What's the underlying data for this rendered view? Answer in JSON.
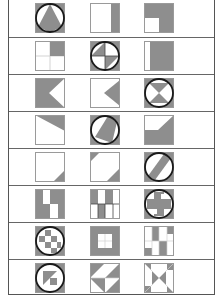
{
  "colors": {
    "fill": "#8e8e8e",
    "outline": "#9a9a9a",
    "circle": "#1a1a1a",
    "background": "#ffffff",
    "divider": "#666666"
  },
  "layout": {
    "row_height": 37,
    "col_x": [
      34,
      89,
      143
    ]
  },
  "rows": [
    {
      "tiles": [
        {
          "name": "triangle-in-circle",
          "circle": true,
          "shapes": [
            {
              "t": "rect",
              "x": 0,
              "y": 0,
              "w": 30,
              "h": 30
            },
            {
              "t": "circle-white"
            },
            {
              "t": "poly",
              "p": "15,1 27,24 15,29 3,24"
            }
          ]
        },
        {
          "name": "right-strip",
          "shapes": [
            {
              "t": "rect",
              "x": 21,
              "y": 0,
              "w": 9,
              "h": 30
            }
          ]
        },
        {
          "name": "l-shape-missing-bottom-left",
          "shapes": [
            {
              "t": "poly",
              "p": "0,0 30,0 30,30 15,30 15,15 0,15"
            }
          ]
        }
      ]
    },
    {
      "tiles": [
        {
          "name": "top-right-quadrant",
          "grid": true,
          "shapes": [
            {
              "t": "rect",
              "x": 15,
              "y": 0,
              "w": 15,
              "h": 15
            }
          ]
        },
        {
          "name": "quadrants-in-circle",
          "circle": true,
          "shapes": [
            {
              "t": "rect",
              "x": 0,
              "y": 0,
              "w": 30,
              "h": 30
            },
            {
              "t": "circle-white"
            },
            {
              "t": "poly",
              "p": "15,15 15,1 1,15"
            },
            {
              "t": "poly",
              "p": "15,15 29,15 15,29"
            },
            {
              "t": "lines",
              "p": "15,1 15,29 M1,15 29,15"
            }
          ]
        },
        {
          "name": "mostly-filled-left-strip",
          "shapes": [
            {
              "t": "rect",
              "x": 6,
              "y": 0,
              "w": 24,
              "h": 30
            }
          ]
        }
      ]
    },
    {
      "tiles": [
        {
          "name": "arrow-notch-right",
          "shapes": [
            {
              "t": "poly",
              "p": "0,0 30,0 30,0 14,15 30,30 0,30"
            }
          ]
        },
        {
          "name": "triangle-pointing-left",
          "shapes": [
            {
              "t": "poly",
              "p": "30,2 14,15 30,28"
            }
          ]
        },
        {
          "name": "hourglass-in-circle",
          "circle": true,
          "shapes": [
            {
              "t": "rect",
              "x": 0,
              "y": 0,
              "w": 30,
              "h": 30
            },
            {
              "t": "circle-white"
            },
            {
              "t": "poly",
              "p": "5,5 25,5 15,15"
            },
            {
              "t": "poly",
              "p": "5,25 25,25 15,15"
            }
          ]
        }
      ]
    },
    {
      "tiles": [
        {
          "name": "top-wedge",
          "shapes": [
            {
              "t": "poly",
              "p": "0,0 30,0 30,16"
            }
          ]
        },
        {
          "name": "slanted-band-in-circle",
          "circle": true,
          "shapes": [
            {
              "t": "rect",
              "x": 0,
              "y": 0,
              "w": 30,
              "h": 30
            },
            {
              "t": "circle-white"
            },
            {
              "t": "poly",
              "p": "18,1 27,7 22,28 5,22"
            }
          ]
        },
        {
          "name": "bottom-with-step",
          "shapes": [
            {
              "t": "poly",
              "p": "0,15 14,15 30,0 30,30 0,30"
            }
          ]
        }
      ]
    },
    {
      "tiles": [
        {
          "name": "bottom-right-corner-triangle",
          "shapes": [
            {
              "t": "poly",
              "p": "30,18 30,30 18,30"
            }
          ]
        },
        {
          "name": "two-corner-triangles",
          "shapes": [
            {
              "t": "poly",
              "p": "0,0 10,0 0,10"
            },
            {
              "t": "poly",
              "p": "30,16 30,30 16,30"
            }
          ]
        },
        {
          "name": "diagonal-band-in-circle",
          "circle": true,
          "shapes": [
            {
              "t": "rect",
              "x": 0,
              "y": 0,
              "w": 30,
              "h": 30
            },
            {
              "t": "circle-white"
            },
            {
              "t": "poly",
              "p": "20,2 27,6 11,28 4,24"
            }
          ]
        }
      ]
    },
    {
      "tiles": [
        {
          "name": "checker-columns-a",
          "shapes": [
            {
              "t": "rect",
              "x": 0,
              "y": 0,
              "w": 8,
              "h": 15
            },
            {
              "t": "rect",
              "x": 15,
              "y": 0,
              "w": 8,
              "h": 15
            },
            {
              "t": "rect",
              "x": 0,
              "y": 15,
              "w": 8,
              "h": 15
            },
            {
              "t": "rect",
              "x": 8,
              "y": 15,
              "w": 7,
              "h": 15
            },
            {
              "t": "rect",
              "x": 23,
              "y": 0,
              "w": 7,
              "h": 30
            }
          ]
        },
        {
          "name": "checker-columns-b",
          "shapes": [
            {
              "t": "rect",
              "x": 0,
              "y": 0,
              "w": 8,
              "h": 15
            },
            {
              "t": "rect",
              "x": 15,
              "y": 0,
              "w": 8,
              "h": 15
            },
            {
              "t": "rect",
              "x": 8,
              "y": 15,
              "w": 7,
              "h": 15
            },
            {
              "t": "lines",
              "p": "0,15 30,15 M8,15 8,30 M15,15 15,30 M23,15 23,30"
            }
          ]
        },
        {
          "name": "cross-in-circle",
          "circle": true,
          "shapes": [
            {
              "t": "rect",
              "x": 0,
              "y": 0,
              "w": 30,
              "h": 30
            },
            {
              "t": "circle-white"
            },
            {
              "t": "poly",
              "p": "10,3 20,3 20,10 27,10 27,20 20,20 20,27 10,27 10,20 3,20 3,10 10,10"
            },
            {
              "t": "rect-white",
              "x": 17,
              "y": 5,
              "w": 7,
              "h": 5
            },
            {
              "t": "rect-white",
              "x": 6,
              "y": 20,
              "w": 7,
              "h": 5
            }
          ]
        }
      ]
    },
    {
      "tiles": [
        {
          "name": "checkerboard-in-circle",
          "circle": true,
          "shapes": [
            {
              "t": "rect",
              "x": 0,
              "y": 0,
              "w": 30,
              "h": 30
            },
            {
              "t": "circle-white"
            },
            {
              "t": "rect",
              "x": 10,
              "y": 4,
              "w": 6,
              "h": 6
            },
            {
              "t": "rect",
              "x": 4,
              "y": 10,
              "w": 6,
              "h": 6
            },
            {
              "t": "rect",
              "x": 16,
              "y": 10,
              "w": 6,
              "h": 6
            },
            {
              "t": "rect",
              "x": 10,
              "y": 16,
              "w": 6,
              "h": 6
            },
            {
              "t": "rect",
              "x": 22,
              "y": 16,
              "w": 4,
              "h": 6
            },
            {
              "t": "rect",
              "x": 16,
              "y": 22,
              "w": 6,
              "h": 5
            }
          ]
        },
        {
          "name": "framed-window",
          "shapes": [
            {
              "t": "rect",
              "x": 0,
              "y": 0,
              "w": 30,
              "h": 30
            },
            {
              "t": "rect-white",
              "x": 8,
              "y": 8,
              "w": 14,
              "h": 14
            },
            {
              "t": "lines-light",
              "p": "15,8 15,22 M8,15 22,15"
            }
          ]
        },
        {
          "name": "scattered-blocks",
          "shapes": [
            {
              "t": "rect",
              "x": 8,
              "y": 0,
              "w": 7,
              "h": 15
            },
            {
              "t": "rect",
              "x": 23,
              "y": 0,
              "w": 7,
              "h": 8
            },
            {
              "t": "rect",
              "x": 15,
              "y": 15,
              "w": 8,
              "h": 15
            },
            {
              "t": "rect",
              "x": 0,
              "y": 22,
              "w": 8,
              "h": 8
            },
            {
              "t": "lines-light",
              "p": "0,15 30,15 M8,0 8,30 M15,0 15,30 M23,0 23,30"
            }
          ]
        }
      ]
    },
    {
      "tiles": [
        {
          "name": "diagonal-triangles-in-circle",
          "circle": true,
          "shapes": [
            {
              "t": "rect",
              "x": 0,
              "y": 0,
              "w": 30,
              "h": 30
            },
            {
              "t": "circle-white"
            },
            {
              "t": "poly",
              "p": "8,8 22,8 8,22"
            },
            {
              "t": "rect",
              "x": 15,
              "y": 15,
              "w": 7,
              "h": 7
            }
          ]
        },
        {
          "name": "pinwheel-triangles",
          "shapes": [
            {
              "t": "poly",
              "p": "0,0 15,0 0,15"
            },
            {
              "t": "poly",
              "p": "15,15 30,0 30,15"
            },
            {
              "t": "poly",
              "p": "0,15 15,15 15,30"
            },
            {
              "t": "poly",
              "p": "15,30 30,15 30,30"
            },
            {
              "t": "lines-light",
              "p": "0,15 30,15"
            }
          ]
        },
        {
          "name": "bowtie-corners",
          "shapes": [
            {
              "t": "poly",
              "p": "0,0 7,0 7,7"
            },
            {
              "t": "rect",
              "x": 23,
              "y": 0,
              "w": 7,
              "h": 7
            },
            {
              "t": "rect",
              "x": 0,
              "y": 23,
              "w": 7,
              "h": 7
            },
            {
              "t": "poly",
              "p": "23,23 30,30 23,30"
            },
            {
              "t": "poly",
              "p": "8,8 15,15 8,22"
            },
            {
              "t": "poly",
              "p": "22,8 15,15 22,22"
            },
            {
              "t": "lines-light",
              "p": "0,0 30,30 M30,0 0,30"
            }
          ]
        }
      ]
    }
  ]
}
